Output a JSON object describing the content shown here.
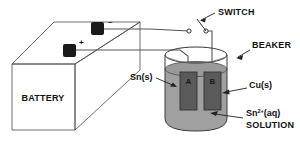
{
  "figure": {
    "background_color": "#ffffff",
    "ink_color": "#111111"
  },
  "labels": {
    "battery": "BATTERY",
    "switch": "SWITCH",
    "beaker": "BEAKER",
    "tin_electrode": "Sn(s)",
    "copper_electrode": "Cu(s)",
    "solution_formula_main": "Sn",
    "solution_formula_superscript": "2+",
    "solution_formula_state": "(aq)",
    "solution_word": "SOLUTION",
    "electrode_a": "A",
    "electrode_b": "B",
    "terminal_positive": "+",
    "terminal_negative": "–"
  },
  "components": {
    "battery": {
      "name": "battery",
      "shape": "rectangular-prism",
      "terminals": [
        "+",
        "–"
      ],
      "terminal_color": "#1a1a1a",
      "face_color": "#ffffff",
      "edge_color": "#4a4a4a"
    },
    "switch": {
      "name": "knife-switch",
      "state": "open",
      "contacts": 2,
      "contact_color": "#ffffff"
    },
    "beaker": {
      "name": "beaker",
      "glass_color": "#3a3a3a",
      "solution_color": "#a0a0a0",
      "solution_label": "Sn2+(aq) SOLUTION",
      "liquid_level": "below-rim"
    },
    "electrodes": [
      {
        "id": "A",
        "label": "A",
        "material_label": "Sn(s)",
        "material_name": "tin",
        "color": "#5a5a5a",
        "position": "left"
      },
      {
        "id": "B",
        "label": "B",
        "material_label": "Cu(s)",
        "material_name": "copper",
        "color": "#5a5a5a",
        "position": "right"
      }
    ],
    "wires": {
      "name": "connecting-wires",
      "color": "#555555",
      "count": 2
    }
  },
  "colors": {
    "ink": "#111111",
    "edge": "#4a4a4a",
    "wire": "#555555",
    "solution": "#a0a0a0",
    "electrode": "#5a5a5a",
    "terminal": "#1a1a1a"
  }
}
